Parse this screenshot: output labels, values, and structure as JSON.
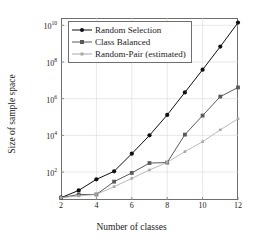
{
  "chart_data": {
    "type": "line",
    "title": "",
    "xlabel": "Number of classes",
    "ylabel": "Size of sample space",
    "x": [
      2,
      3,
      4,
      5,
      6,
      7,
      8,
      9,
      10,
      11,
      12
    ],
    "xlim": [
      2,
      12
    ],
    "ylim": [
      3,
      25000000000.0
    ],
    "yscale": "log",
    "xticks": [
      "2",
      "4",
      "6",
      "8",
      "10",
      "12"
    ],
    "xtick_values": [
      2,
      4,
      6,
      8,
      10,
      12
    ],
    "yticks": [
      "10^2",
      "10^4",
      "10^6",
      "10^8",
      "10^10"
    ],
    "ytick_values": [
      100,
      10000,
      1000000,
      100000000,
      10000000000
    ],
    "ytick_mantissa": [
      "10",
      "10",
      "10",
      "10",
      "10"
    ],
    "ytick_exponent": [
      "2",
      "4",
      "6",
      "8",
      "10"
    ],
    "grid": true,
    "grid_color": "#d9d9d9",
    "legend_position": "top-left",
    "series": [
      {
        "name": "Random Selection",
        "color": "#101010",
        "marker": "circle",
        "values": [
          4,
          10,
          40,
          110,
          1000,
          10000,
          130000,
          2200000,
          38000000,
          690000000,
          14000000000
        ]
      },
      {
        "name": "Class Balanced",
        "color": "#5a5a5a",
        "marker": "square",
        "values": [
          4,
          6,
          6,
          30,
          90,
          310,
          330,
          11000,
          120000,
          1300000,
          4100000
        ]
      },
      {
        "name": "Random-Pair (estimated)",
        "color": "#a8a8a8",
        "marker": "square-small",
        "values": [
          4,
          5,
          6,
          16,
          45,
          130,
          340,
          1300,
          4500,
          20000,
          80000
        ]
      }
    ]
  },
  "legend": {
    "items": [
      {
        "label": "Random Selection"
      },
      {
        "label": "Class Balanced"
      },
      {
        "label": "Random-Pair (estimated)"
      }
    ]
  }
}
